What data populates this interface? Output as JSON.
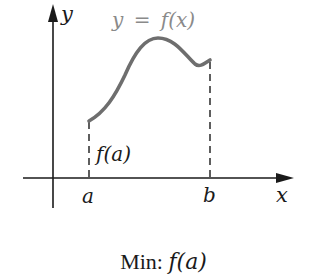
{
  "figure": {
    "y_axis_label": "y",
    "x_axis_label": "x",
    "curve_label": "y = f(x)",
    "point_a_label": "a",
    "point_b_label": "b",
    "value_label": "f(a)",
    "caption_prefix": "Min: ",
    "caption_value": "f(a)",
    "colors": {
      "axis": "#1a1a1a",
      "curve": "#6e6e6e",
      "curve_label": "#8a8a8a",
      "text": "#1a1a1a"
    }
  }
}
